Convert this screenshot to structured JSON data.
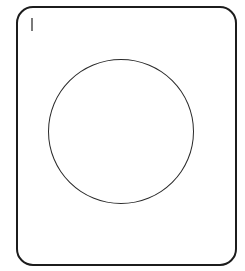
{
  "canvas": {
    "width": 245,
    "height": 271,
    "background": "#ffffff"
  },
  "frame": {
    "shape": "rounded-rectangle",
    "stroke_color": "#1c1c1c"
  },
  "mark": {
    "text": "I",
    "color": "#7a7a7a"
  },
  "circle": {
    "shape": "circle",
    "stroke_color": "#2a2a2a"
  }
}
